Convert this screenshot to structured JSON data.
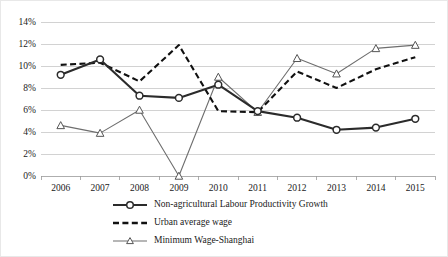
{
  "chart_data": {
    "type": "line",
    "title": "",
    "subtitle": "",
    "xlabel": "",
    "ylabel": "",
    "categories": [
      "2006",
      "2007",
      "2008",
      "2009",
      "2010",
      "2011",
      "2012",
      "2013",
      "2014",
      "2015"
    ],
    "ylim": [
      0,
      14
    ],
    "ytick_step": 2,
    "ytick_labels": [
      "0%",
      "2%",
      "4%",
      "6%",
      "8%",
      "10%",
      "12%",
      "14%"
    ],
    "ytick_values": [
      0,
      2,
      4,
      6,
      8,
      10,
      12,
      14
    ],
    "grid": true,
    "legend_position": "bottom",
    "series": [
      {
        "name": "Non-agricultural Labour Productivity Growth",
        "marker": "circle",
        "line_style": "solid-thick",
        "color": "#2b2b2b",
        "values": [
          9.2,
          10.6,
          7.3,
          7.1,
          8.3,
          5.9,
          5.3,
          4.2,
          4.4,
          5.2
        ]
      },
      {
        "name": "Urban average wage",
        "marker": "none",
        "line_style": "dashed",
        "color": "#111111",
        "values": [
          10.1,
          10.3,
          8.6,
          11.9,
          5.9,
          5.8,
          9.5,
          8.0,
          9.7,
          10.8
        ]
      },
      {
        "name": "Minimum Wage-Shanghai",
        "marker": "triangle",
        "line_style": "solid-thin",
        "color": "#6e6e6e",
        "values": [
          4.6,
          3.9,
          6.0,
          0.0,
          9.0,
          5.8,
          10.7,
          9.3,
          11.6,
          11.9
        ]
      }
    ]
  },
  "legend": {
    "items": [
      {
        "label": "Non-agricultural Labour Productivity Growth"
      },
      {
        "label": "Urban average wage"
      },
      {
        "label": "Minimum Wage-Shanghai"
      }
    ]
  },
  "colors": {
    "grid": "#bfbfbf",
    "axis": "#9a9a9a",
    "text": "#1a1a1a",
    "series_productivity": "#2b2b2b",
    "series_urban_wage": "#111111",
    "series_min_wage": "#6e6e6e",
    "background": "#ffffff"
  }
}
